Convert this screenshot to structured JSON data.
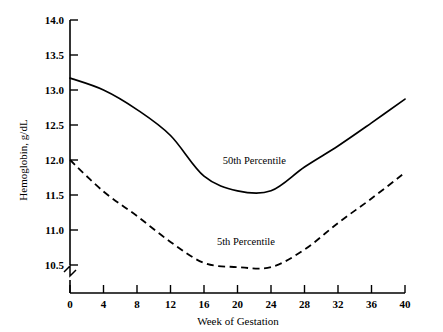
{
  "chart_data": {
    "type": "line",
    "title": "",
    "xlabel": "Week of Gestation",
    "ylabel": "Hemoglobin, g/dL",
    "x": [
      0,
      4,
      8,
      12,
      16,
      20,
      24,
      28,
      32,
      36,
      40
    ],
    "xticklabels": [
      "0",
      "4",
      "8",
      "12",
      "16",
      "20",
      "24",
      "28",
      "32",
      "36",
      "40"
    ],
    "yticklabels": [
      "10.5",
      "11.0",
      "11.5",
      "12.0",
      "12.5",
      "13.0",
      "13.5",
      "14.0"
    ],
    "yticks": [
      10.5,
      11.0,
      11.5,
      12.0,
      12.5,
      13.0,
      13.5,
      14.0
    ],
    "xlim": [
      0,
      40
    ],
    "ylim": [
      10.5,
      14.0
    ],
    "grid": false,
    "legend_position": "inline-annotations",
    "axis_break": true,
    "series": [
      {
        "name": "50th Percentile",
        "style": "solid",
        "color": "#000000",
        "values": [
          13.17,
          13.0,
          12.72,
          12.35,
          11.77,
          11.56,
          11.56,
          11.9,
          12.2,
          12.53,
          12.87
        ],
        "label_x": 22,
        "label_y": 11.95
      },
      {
        "name": "5th Percentile",
        "style": "dashed",
        "color": "#000000",
        "values": [
          12.0,
          11.55,
          11.2,
          10.83,
          10.53,
          10.47,
          10.47,
          10.72,
          11.1,
          11.45,
          11.82
        ],
        "label_x": 21,
        "label_y": 10.78
      }
    ]
  },
  "labels": {
    "y_axis_title": "Hemoglobin, g/dL",
    "x_axis_title": "Week of Gestation",
    "series_50th": "50th Percentile",
    "series_5th": "5th Percentile",
    "ytick_14_0": "14.0",
    "ytick_13_5": "13.5",
    "ytick_13_0": "13.0",
    "ytick_12_5": "12.5",
    "ytick_12_0": "12.0",
    "ytick_11_5": "11.5",
    "ytick_11_0": "11.0",
    "ytick_10_5": "10.5",
    "xtick_0": "0",
    "xtick_4": "4",
    "xtick_8": "8",
    "xtick_12": "12",
    "xtick_16": "16",
    "xtick_20": "20",
    "xtick_24": "24",
    "xtick_28": "28",
    "xtick_32": "32",
    "xtick_36": "36",
    "xtick_40": "40"
  }
}
